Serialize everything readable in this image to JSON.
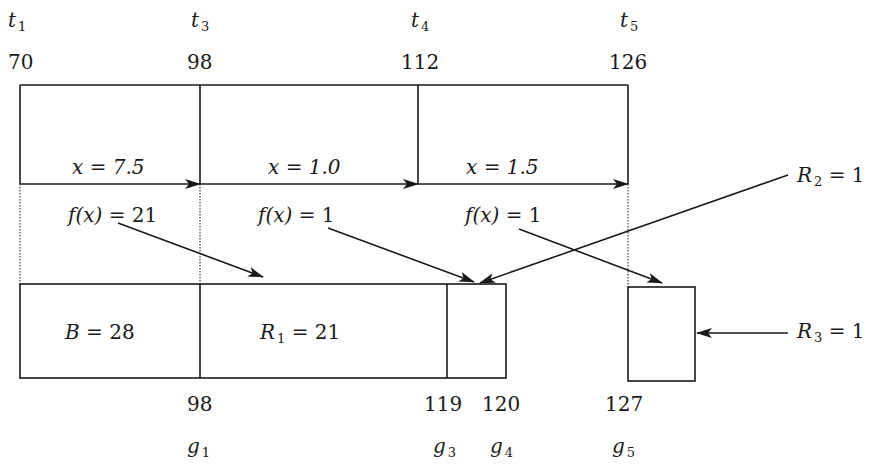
{
  "diagram": {
    "top_markers": [
      {
        "label": "t",
        "sub": "1",
        "value": "70"
      },
      {
        "label": "t",
        "sub": "3",
        "value": "98"
      },
      {
        "label": "t",
        "sub": "4",
        "value": "112"
      },
      {
        "label": "t",
        "sub": "5",
        "value": "126"
      }
    ],
    "intervals": [
      {
        "x_label": "x = 7.5",
        "f_label_pre": "f(x) = ",
        "f_value": "21"
      },
      {
        "x_label": "x = 1.0",
        "f_label_pre": "f(x) = ",
        "f_value": "1"
      },
      {
        "x_label": "x = 1.5",
        "f_label_pre": "f(x) = ",
        "f_value": "1"
      }
    ],
    "right_labels": [
      {
        "label": "R",
        "sub": "2",
        "rest": " = 1"
      },
      {
        "label": "R",
        "sub": "3",
        "rest": " = 1"
      }
    ],
    "bottom_cells": [
      {
        "label": "B",
        "rest": " = 28"
      },
      {
        "label": "R",
        "sub": "1",
        "rest": " = 21"
      }
    ],
    "bottom_markers": [
      {
        "label": "g",
        "sub": "1",
        "value": "98"
      },
      {
        "label": "g",
        "sub": "3",
        "value": "119"
      },
      {
        "label": "g",
        "sub": "4",
        "value": "120"
      },
      {
        "label": "g",
        "sub": "5",
        "value": "127"
      }
    ],
    "colors": {
      "ink": "#1a1a1a",
      "background": "#ffffff"
    }
  }
}
